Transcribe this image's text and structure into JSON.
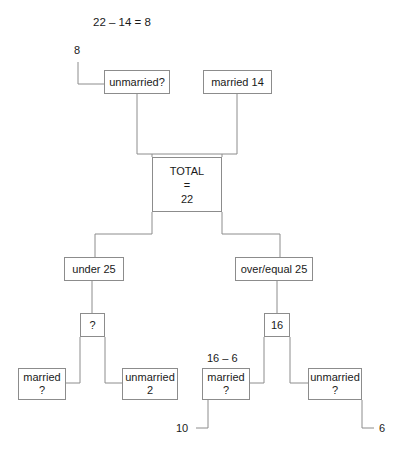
{
  "diagram": {
    "type": "tree-diagram",
    "title_equation": "22 – 14 = 8",
    "stroke_color": "#8c8c8c",
    "background": "#ffffff",
    "annotations": {
      "top_left_value": "8",
      "subtract_label": "16 – 6",
      "bottom_left_value": "10",
      "bottom_right_value": "6"
    },
    "nodes": {
      "unmarried_top": {
        "line1": "unmarried?",
        "line2": ""
      },
      "married_top": {
        "line1": "married 14",
        "line2": ""
      },
      "total": {
        "line1": "TOTAL",
        "line2": "=",
        "line3": "22"
      },
      "under25": {
        "line1": "under 25",
        "line2": ""
      },
      "over_equal25": {
        "line1": "over/equal 25",
        "line2": ""
      },
      "question_left": {
        "line1": "?",
        "line2": ""
      },
      "sixteen": {
        "line1": "16",
        "line2": ""
      },
      "married_left": {
        "line1": "married",
        "line2": "?"
      },
      "unmarried_left": {
        "line1": "unmarried",
        "line2": "2"
      },
      "married_right": {
        "line1": "married",
        "line2": "?"
      },
      "unmarried_right": {
        "line1": "unmarried",
        "line2": "?"
      }
    }
  }
}
